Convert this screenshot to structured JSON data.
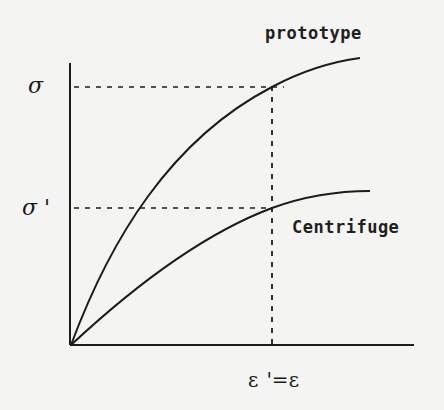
{
  "diagram": {
    "type": "stress-strain comparison",
    "curves": [
      {
        "name": "prototype",
        "label": "prototype",
        "shape": "concave rising from origin, steeper",
        "end_point_px": [
          360,
          58
        ]
      },
      {
        "name": "centrifuge",
        "label": "Centrifuge",
        "shape": "concave rising from origin, shallower",
        "end_point_px": [
          370,
          191
        ]
      }
    ],
    "y_axis": {
      "labels": [
        {
          "id": "sigma",
          "text": "σ",
          "level_px": 87
        },
        {
          "id": "sigma_prime",
          "text": "σ '",
          "level_px": 208
        }
      ]
    },
    "x_axis": {
      "label": "ε '=ε",
      "strain_text": "ε",
      "prime_equals_text": "'=",
      "strain_text_2": "ε",
      "marker_px": 272
    },
    "guides": [
      {
        "from": "sigma level",
        "to": "prototype curve at ε",
        "style": "dashed"
      },
      {
        "from": "sigma' level",
        "to": "centrifuge curve at ε'",
        "style": "dashed"
      },
      {
        "from": "x-axis at ε'=ε",
        "to": "prototype curve",
        "style": "dashed vertical"
      }
    ],
    "colors": {
      "ink": "#1c1c1c",
      "paper": "#f4f4f2"
    }
  }
}
